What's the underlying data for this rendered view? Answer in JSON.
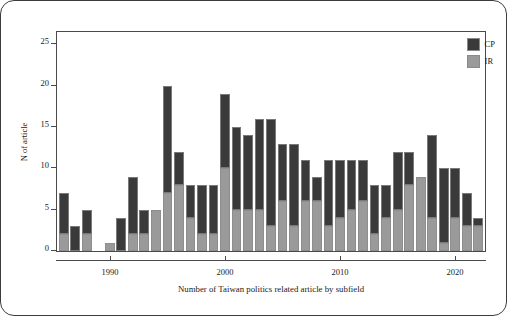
{
  "figure": {
    "y_axis_title": "N of article",
    "x_axis_title": "Number of Taiwan politics related article by subfield"
  },
  "legend": {
    "position": "top-right",
    "entries": [
      {
        "label": "CP",
        "color": "#3a3a3a",
        "key": "cp"
      },
      {
        "label": "IR",
        "color": "#9a9a9a",
        "key": "ir"
      }
    ]
  },
  "axes": {
    "y_ticks": [
      0,
      5,
      10,
      15,
      20,
      25
    ],
    "y_tick_labels": [
      "0",
      "5",
      "10",
      "15",
      "20",
      "25"
    ],
    "x_ticks": [
      1990,
      2000,
      2010,
      2020
    ],
    "x_tick_labels": [
      "1990",
      "2000",
      "2010",
      "2020"
    ],
    "ylim": [
      0,
      26.5
    ],
    "xlim": [
      1985.4,
      2022.6
    ],
    "grid": false
  },
  "chart_data": {
    "type": "bar",
    "subtype": "stacked",
    "title": "",
    "subtitle": "",
    "xlabel": "Number of Taiwan politics related article by subfield",
    "ylabel": "N of article",
    "ylim": [
      0,
      26.5
    ],
    "grid": false,
    "legend_position": "top-right",
    "categories": [
      1986,
      1987,
      1988,
      1989,
      1990,
      1991,
      1992,
      1993,
      1994,
      1995,
      1996,
      1997,
      1998,
      1999,
      2000,
      2001,
      2002,
      2003,
      2004,
      2005,
      2006,
      2007,
      2008,
      2009,
      2010,
      2011,
      2012,
      2013,
      2014,
      2015,
      2016,
      2017,
      2018,
      2019,
      2020,
      2021,
      2022
    ],
    "series": [
      {
        "name": "IR",
        "color": "#9a9a9a",
        "values": [
          2,
          0,
          2,
          0,
          1,
          0,
          2,
          2,
          5,
          7,
          8,
          4,
          2,
          2,
          10,
          5,
          5,
          5,
          3,
          6,
          3,
          6,
          6,
          3,
          4,
          5,
          6,
          2,
          4,
          5,
          8,
          9,
          4,
          1,
          4,
          3,
          3
        ]
      },
      {
        "name": "CP",
        "color": "#3a3a3a",
        "values": [
          5,
          3,
          3,
          0,
          0,
          4,
          7,
          3,
          0,
          13,
          4,
          4,
          6,
          6,
          9,
          10,
          9,
          11,
          13,
          7,
          10,
          5,
          3,
          8,
          7,
          6,
          5,
          6,
          4,
          7,
          4,
          0,
          10,
          9,
          6,
          4,
          1
        ]
      }
    ],
    "totals": [
      7,
      3,
      5,
      0,
      1,
      4,
      9,
      5,
      5,
      20,
      12,
      8,
      8,
      8,
      19,
      15,
      14,
      16,
      16,
      13,
      13,
      11,
      9,
      11,
      11,
      11,
      11,
      8,
      8,
      12,
      12,
      9,
      14,
      10,
      10,
      7,
      4
    ]
  }
}
